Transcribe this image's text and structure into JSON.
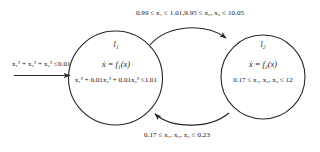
{
  "diagram": {
    "type": "hybrid-automaton",
    "title": "",
    "stroke_color": "#262626",
    "text_color": "#151515",
    "background": "#ffffff"
  },
  "initial": {
    "condition": "x₁² + x₂² + x₃² ≤0.01",
    "arrow": "initial-arrow"
  },
  "modes": [
    {
      "id": "l1",
      "name": "l₁",
      "dynamics": "ẋ = f₁(x)",
      "invariant": "x₁² + 0.01x₂² + 0.01x₃² ≤1.01"
    },
    {
      "id": "l2",
      "name": "l₂",
      "dynamics": "ẋ = f₂(x)",
      "invariant": "0.17 ≤ x₁, x₂, x₃ ≤ 12"
    }
  ],
  "transitions": [
    {
      "id": "t-l1-to-l2",
      "from": "l1",
      "to": "l2",
      "guard": "0.99 ≤ x₁ ≤ 1.01,9.95 ≤ x₂, x₃ ≤ 10.05",
      "position": "top"
    },
    {
      "id": "t-l2-to-l1",
      "from": "l2",
      "to": "l1",
      "guard": "0.17 ≤ x₁, x₂, x₃ ≤ 0.23",
      "position": "bottom"
    }
  ]
}
